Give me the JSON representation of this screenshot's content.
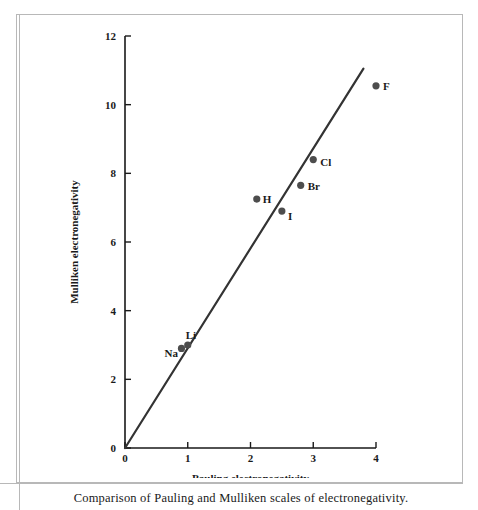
{
  "figure": {
    "caption": "Comparison of Pauling and Mulliken scales of electronegativity."
  },
  "chart_data": {
    "type": "scatter",
    "title": "",
    "xlabel": "Pauling electronegativity",
    "ylabel": "Mulliken electronegativity",
    "xlim": [
      0,
      4
    ],
    "ylim": [
      0,
      12
    ],
    "xticks": [
      "0",
      "1",
      "2",
      "3",
      "4"
    ],
    "xtick_values": [
      0,
      1,
      2,
      3,
      4
    ],
    "yticks": [
      "0",
      "2",
      "4",
      "6",
      "8",
      "10",
      "12"
    ],
    "ytick_values": [
      0,
      2,
      4,
      6,
      8,
      10,
      12
    ],
    "grid": false,
    "legend": "none",
    "points": [
      {
        "label": "Na",
        "x": 0.9,
        "y": 2.9,
        "label_dx": -17,
        "label_dy": 9
      },
      {
        "label": "Li",
        "x": 1.0,
        "y": 3.0,
        "label_dx": -2,
        "label_dy": -6
      },
      {
        "label": "I",
        "x": 2.5,
        "y": 6.9,
        "label_dx": 6,
        "label_dy": 9
      },
      {
        "label": "H",
        "x": 2.1,
        "y": 7.25,
        "label_dx": 6,
        "label_dy": 4
      },
      {
        "label": "Br",
        "x": 2.8,
        "y": 7.65,
        "label_dx": 7,
        "label_dy": 5
      },
      {
        "label": "Cl",
        "x": 3.0,
        "y": 8.4,
        "label_dx": 7,
        "label_dy": 6
      },
      {
        "label": "F",
        "x": 4.0,
        "y": 10.55,
        "label_dx": 7,
        "label_dy": 4
      }
    ],
    "trend_line": {
      "description": "straight reference line through the origin",
      "x0": 0.0,
      "y0": 0.0,
      "x1": 3.8,
      "y1": 11.05
    },
    "colors": {
      "axis": "#1a1a1a",
      "marker": "#4d4d4d",
      "line": "#333333",
      "frame": "#b8b8b8",
      "background": "#ffffff"
    }
  }
}
